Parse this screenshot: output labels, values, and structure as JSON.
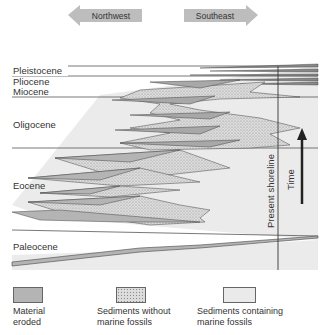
{
  "direction_arrows": {
    "left": "Northwest",
    "right": "Southeast"
  },
  "epochs": [
    {
      "label": "Pleistocene"
    },
    {
      "label": "Pliocene"
    },
    {
      "label": "Miocene"
    },
    {
      "label": "Oligocene"
    },
    {
      "label": "Eocene"
    },
    {
      "label": "Paleocene"
    }
  ],
  "vertical_labels": {
    "shoreline": "Present shoreline",
    "time": "Time"
  },
  "legend": [
    {
      "label": "Material\neroded",
      "color": "#b4b4b4",
      "pattern": "solid"
    },
    {
      "label": "Sediments without\nmarine fossils",
      "color": "#d2d2d2",
      "pattern": "stipple"
    },
    {
      "label": "Sediments containing\nmarine fossils",
      "color": "#eaeaea",
      "pattern": "solid"
    }
  ],
  "colors": {
    "marine_background": "#ebebeb",
    "eroded": "#b4b4b4",
    "nonmarine": "#d2d2d2",
    "arrow_fill": "#bdbdbd",
    "line": "#444444"
  }
}
